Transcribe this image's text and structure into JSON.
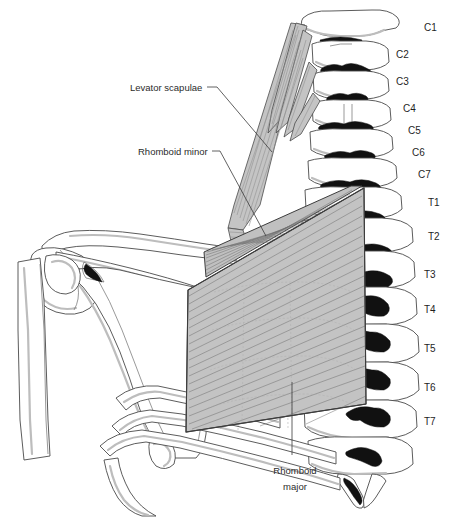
{
  "figure": {
    "view": "posterior view of cervical and upper thoracic spine with scapula",
    "background_color": "#ffffff",
    "line_color": "#4a4a4a",
    "muscle_fill_color": "#c3c3c3",
    "spinous_process_color": "#111111"
  },
  "muscle_labels": [
    {
      "id": "levator-scapulae",
      "text": "Levator scapulae",
      "lines": [
        "Levator scapulae"
      ],
      "x": 130,
      "y": 91,
      "anchor": "start"
    },
    {
      "id": "rhomboid-minor",
      "text": "Rhomboid minor",
      "lines": [
        "Rhomboid minor"
      ],
      "x": 138,
      "y": 155,
      "anchor": "start"
    },
    {
      "id": "rhomboid-major",
      "text": "Rhomboid major",
      "lines": [
        "Rhomboid",
        "major"
      ],
      "line1": "Rhomboid",
      "line2": "major",
      "x": 295,
      "y": 474,
      "anchor": "middle"
    }
  ],
  "vertebra_labels": [
    {
      "id": "C1",
      "text": "C1",
      "x": 424,
      "y": 31
    },
    {
      "id": "C2",
      "text": "C2",
      "x": 396,
      "y": 58
    },
    {
      "id": "C3",
      "text": "C3",
      "x": 396,
      "y": 85
    },
    {
      "id": "C4",
      "text": "C4",
      "x": 403,
      "y": 112
    },
    {
      "id": "C5",
      "text": "C5",
      "x": 408,
      "y": 134
    },
    {
      "id": "C6",
      "text": "C6",
      "x": 412,
      "y": 156
    },
    {
      "id": "C7",
      "text": "C7",
      "x": 418,
      "y": 178
    },
    {
      "id": "T1",
      "text": "T1",
      "x": 428,
      "y": 206
    },
    {
      "id": "T2",
      "text": "T2",
      "x": 428,
      "y": 240
    },
    {
      "id": "T3",
      "text": "T3",
      "x": 424,
      "y": 278
    },
    {
      "id": "T4",
      "text": "T4",
      "x": 424,
      "y": 313
    },
    {
      "id": "T5",
      "text": "T5",
      "x": 424,
      "y": 352
    },
    {
      "id": "T6",
      "text": "T6",
      "x": 424,
      "y": 391
    },
    {
      "id": "T7",
      "text": "T7",
      "x": 424,
      "y": 425
    }
  ],
  "structures": [
    {
      "id": "humerus",
      "name": "humerus"
    },
    {
      "id": "scapula",
      "name": "scapula"
    },
    {
      "id": "clavicle",
      "name": "clavicle"
    },
    {
      "id": "acromion",
      "name": "acromion"
    },
    {
      "id": "ribs",
      "name": "ribs"
    },
    {
      "id": "cervical-spine",
      "name": "cervical vertebrae C1-C7"
    },
    {
      "id": "thoracic-spine",
      "name": "thoracic vertebrae T1-T7"
    }
  ]
}
